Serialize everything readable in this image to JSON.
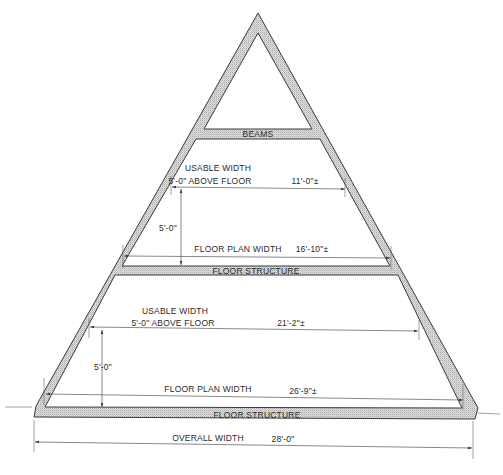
{
  "diagram": {
    "labels": {
      "beams": "BEAMS",
      "upper_usable_width_line1": "USABLE WIDTH",
      "upper_usable_width_line2": "5'-0\" ABOVE FLOOR",
      "upper_usable_width_value": "11'-0\"±",
      "upper_height": "5'-0\"",
      "upper_floor_plan_width": "FLOOR PLAN WIDTH",
      "upper_floor_plan_value": "16'-10\"±",
      "upper_floor_structure": "FLOOR STRUCTURE",
      "lower_usable_width_line1": "USABLE WIDTH",
      "lower_usable_width_line2": "5'-0\" ABOVE FLOOR",
      "lower_usable_width_value": "21'-2\"±",
      "lower_height": "5'-0\"",
      "lower_floor_plan_width": "FLOOR PLAN WIDTH",
      "lower_floor_plan_value": "26'-9\"±",
      "lower_floor_structure": "FLOOR STRUCTURE",
      "overall_width": "OVERALL WIDTH",
      "overall_width_value": "28'-0\""
    },
    "colors": {
      "line": "#3a3a3a",
      "hatch": "#bdbdbd",
      "text": "#2a2a2a",
      "background": "#ffffff"
    }
  }
}
